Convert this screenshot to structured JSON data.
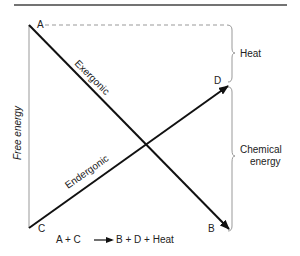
{
  "diagram": {
    "points": {
      "A": "A",
      "B": "B",
      "C": "C",
      "D": "D"
    },
    "line_labels": {
      "exergonic": "Exergonic",
      "endergonic": "Endergonic"
    },
    "axis_label": "Free energy",
    "brackets": {
      "heat": "Heat",
      "chemical_line1": "Chemical",
      "chemical_line2": "energy"
    },
    "equation": {
      "lhs": "A + C",
      "rhs": "B + D + Heat"
    },
    "colors": {
      "line": "#111111",
      "bracket": "#999999",
      "dashed": "#888888"
    }
  }
}
